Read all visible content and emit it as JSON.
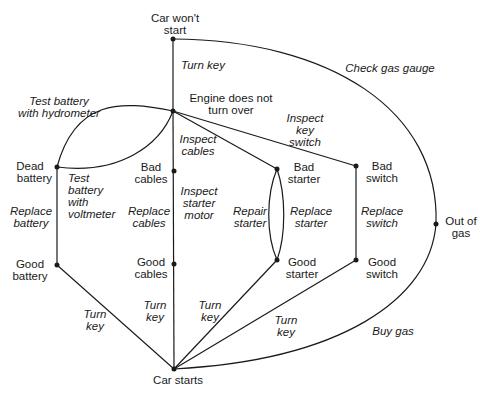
{
  "diagram": {
    "type": "state-transition graph",
    "nodes": [
      {
        "id": "wont_start",
        "label_l1": "Car won't",
        "label_l2": "start",
        "x": 173,
        "y": 39
      },
      {
        "id": "no_turn",
        "label_l1": "Engine does not",
        "label_l2": "turn over",
        "x": 173,
        "y": 111
      },
      {
        "id": "dead_battery",
        "label_l1": "Dead",
        "label_l2": "battery",
        "x": 57,
        "y": 167
      },
      {
        "id": "good_battery",
        "label_l1": "Good",
        "label_l2": "battery",
        "x": 57,
        "y": 265
      },
      {
        "id": "bad_cables",
        "label_l1": "Bad",
        "label_l2": "cables",
        "x": 174,
        "y": 171
      },
      {
        "id": "good_cables",
        "label_l1": "Good",
        "label_l2": "cables",
        "x": 174,
        "y": 264
      },
      {
        "id": "bad_starter",
        "label_l1": "Bad",
        "label_l2": "starter",
        "x": 277,
        "y": 169
      },
      {
        "id": "good_starter",
        "label_l1": "Good",
        "label_l2": "starter",
        "x": 277,
        "y": 260
      },
      {
        "id": "bad_switch",
        "label_l1": "Bad",
        "label_l2": "switch",
        "x": 356,
        "y": 166
      },
      {
        "id": "good_switch",
        "label_l1": "Good",
        "label_l2": "switch",
        "x": 356,
        "y": 260
      },
      {
        "id": "out_of_gas",
        "label_l1": "Out of",
        "label_l2": "gas",
        "x": 436,
        "y": 224
      },
      {
        "id": "car_starts",
        "label_l1": "Car starts",
        "x": 174,
        "y": 369
      }
    ],
    "edges": [
      {
        "from": "wont_start",
        "to": "no_turn",
        "label_l1": "Turn key"
      },
      {
        "from": "wont_start",
        "to": "out_of_gas",
        "label_l1": "Check gas gauge"
      },
      {
        "from": "no_turn",
        "to": "dead_battery",
        "label_l1": "Test battery",
        "label_l2": "with hydrometer"
      },
      {
        "from": "no_turn",
        "to": "dead_battery",
        "label_l1": "Test",
        "label_l2": "battery",
        "label_l3": "with",
        "label_l4": "voltmeter"
      },
      {
        "from": "no_turn",
        "to": "bad_cables",
        "label_l1": "Inspect",
        "label_l2": "cables"
      },
      {
        "from": "no_turn",
        "to": "bad_starter",
        "label_l1": "Inspect",
        "label_l2": "starter",
        "label_l3": "motor"
      },
      {
        "from": "no_turn",
        "to": "bad_switch",
        "label_l1": "Inspect",
        "label_l2": "key",
        "label_l3": "switch"
      },
      {
        "from": "dead_battery",
        "to": "good_battery",
        "label_l1": "Replace",
        "label_l2": "battery"
      },
      {
        "from": "bad_cables",
        "to": "good_cables",
        "label_l1": "Replace",
        "label_l2": "cables"
      },
      {
        "from": "bad_starter",
        "to": "good_starter",
        "label_l1": "Repair",
        "label_l2": "starter"
      },
      {
        "from": "bad_starter",
        "to": "good_starter",
        "label_l1": "Replace",
        "label_l2": "starter"
      },
      {
        "from": "bad_switch",
        "to": "good_switch",
        "label_l1": "Replace",
        "label_l2": "switch"
      },
      {
        "from": "good_battery",
        "to": "car_starts",
        "label_l1": "Turn",
        "label_l2": "key"
      },
      {
        "from": "good_cables",
        "to": "car_starts",
        "label_l1": "Turn",
        "label_l2": "key"
      },
      {
        "from": "good_starter",
        "to": "car_starts",
        "label_l1": "Turn",
        "label_l2": "key"
      },
      {
        "from": "good_switch",
        "to": "car_starts",
        "label_l1": "Turn",
        "label_l2": "key"
      },
      {
        "from": "out_of_gas",
        "to": "car_starts",
        "label_l1": "Buy gas"
      }
    ]
  },
  "labels": {
    "wont_start": [
      "Car won't",
      "start"
    ],
    "no_turn": [
      "Engine does not",
      "turn over"
    ],
    "dead_battery": [
      "Dead",
      "battery"
    ],
    "good_battery": [
      "Good",
      "battery"
    ],
    "bad_cables": [
      "Bad",
      "cables"
    ],
    "good_cables": [
      "Good",
      "cables"
    ],
    "bad_starter": [
      "Bad",
      "starter"
    ],
    "good_starter": [
      "Good",
      "starter"
    ],
    "bad_switch": [
      "Bad",
      "switch"
    ],
    "good_switch": [
      "Good",
      "switch"
    ],
    "out_of_gas": [
      "Out of",
      "gas"
    ],
    "car_starts": "Car starts",
    "e_turn_key_top": "Turn key",
    "e_check_gas": "Check gas gauge",
    "e_hydro": [
      "Test battery",
      "with hydrometer"
    ],
    "e_volt": [
      "Test",
      "battery",
      "with",
      "voltmeter"
    ],
    "e_insp_cables": [
      "Inspect",
      "cables"
    ],
    "e_insp_starter": [
      "Inspect",
      "starter",
      "motor"
    ],
    "e_insp_switch": [
      "Inspect",
      "key",
      "switch"
    ],
    "e_repl_battery": [
      "Replace",
      "battery"
    ],
    "e_repl_cables": [
      "Replace",
      "cables"
    ],
    "e_repair_starter": [
      "Repair",
      "starter"
    ],
    "e_repl_starter": [
      "Replace",
      "starter"
    ],
    "e_repl_switch": [
      "Replace",
      "switch"
    ],
    "e_tk_battery": [
      "Turn",
      "key"
    ],
    "e_tk_cables": [
      "Turn",
      "key"
    ],
    "e_tk_starter": [
      "Turn",
      "key"
    ],
    "e_tk_switch": [
      "Turn",
      "key"
    ],
    "e_buy_gas": "Buy gas"
  },
  "colors": {
    "line": "#1a1a1a",
    "background": "#ffffff"
  }
}
